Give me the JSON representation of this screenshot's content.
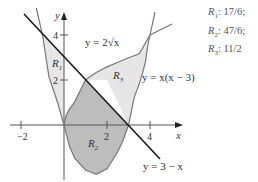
{
  "diagram": {
    "axes": {
      "x_label": "x",
      "y_label": "y",
      "x_ticks": [
        {
          "value": -2,
          "label": "−2"
        },
        {
          "value": 2,
          "label": "2"
        },
        {
          "value": 4,
          "label": "4"
        }
      ],
      "y_ticks": [
        {
          "value": 2,
          "label": "2"
        },
        {
          "value": 4,
          "label": "4"
        }
      ]
    },
    "curves": [
      {
        "name": "sqrt",
        "label": "y = 2√x",
        "equation": "y = 2*sqrt(x)"
      },
      {
        "name": "parabola",
        "label": "y = x(x − 3)",
        "equation": "y = x*(x-3)"
      },
      {
        "name": "line",
        "label": "y = 3 − x",
        "equation": "y = 3 - x"
      }
    ],
    "regions": [
      {
        "id": "R1",
        "label": "R",
        "sub": "1"
      },
      {
        "id": "R2",
        "label": "R",
        "sub": "2"
      },
      {
        "id": "R3",
        "label": "R",
        "sub": "3"
      }
    ],
    "answers": [
      {
        "label": "R",
        "sub": "1",
        "value": ": 17/6;"
      },
      {
        "label": "R",
        "sub": "2",
        "value": ": 47/6;"
      },
      {
        "label": "R",
        "sub": "3",
        "value": ": 11/2"
      }
    ],
    "colors": {
      "region_light": "#e6e6e6",
      "region_dark": "#bdbdbd",
      "curve": "#777777",
      "line": "#1a1a1a",
      "axis": "#555555"
    }
  }
}
